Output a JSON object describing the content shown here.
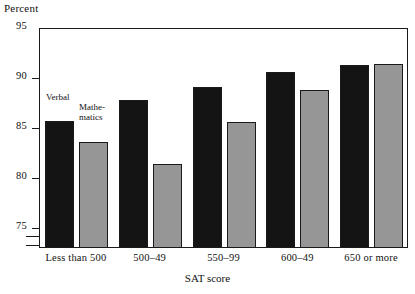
{
  "chart_data": {
    "type": "bar",
    "title": "",
    "subtitle": "",
    "ylabel": "Percent",
    "xlabel": "SAT score",
    "categories": [
      "Less than 500",
      "500–49",
      "550–99",
      "600–49",
      "650 or more"
    ],
    "series": [
      {
        "name": "Verbal",
        "color": "#141414",
        "values": [
          85.7,
          87.8,
          89.1,
          90.6,
          91.3
        ]
      },
      {
        "name": "Mathematics",
        "color": "#969696",
        "values": [
          83.6,
          81.4,
          85.6,
          88.8,
          91.4
        ]
      }
    ],
    "ylim": [
      73,
      95
    ],
    "yticks": [
      95,
      90,
      85,
      80,
      75
    ],
    "ytick_labels": [
      "95",
      "90",
      "85",
      "80",
      "75"
    ],
    "axis_break": true,
    "grid": false,
    "legend_position": "inline-first-group"
  },
  "axes": {
    "y_title": "Percent",
    "x_title": "SAT score",
    "tick_95": "95",
    "tick_90": "90",
    "tick_85": "85",
    "tick_80": "80",
    "tick_75": "75"
  },
  "legend": {
    "verbal": "Verbal",
    "mathematics_line1": "Mathe-",
    "mathematics_line2": "matics"
  },
  "xtick_labels": {
    "c0": "Less than 500",
    "c1": "500–49",
    "c2": "550–99",
    "c3": "600–49",
    "c4": "650 or more"
  }
}
